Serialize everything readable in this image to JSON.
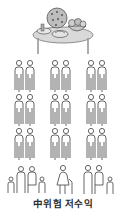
{
  "illustration": {
    "top_item": "food-table",
    "grid": {
      "columns": 3,
      "rows": 3,
      "figures_per_cell": 2,
      "cell_type": "adult-pair"
    },
    "bottom_row": [
      {
        "type": "family-two-adults-two-children"
      },
      {
        "type": "elderly-woman-with-cane"
      },
      {
        "type": "family-two-adults-one-child"
      }
    ],
    "line_color": "#555555"
  },
  "caption": "中위험 저수익"
}
